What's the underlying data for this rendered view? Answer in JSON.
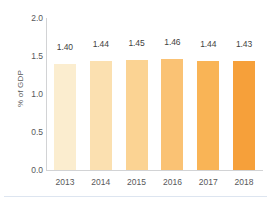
{
  "chart_data": {
    "type": "bar",
    "title": "",
    "subtitle": "",
    "xlabel": "",
    "ylabel": "% of GDP",
    "categories": [
      "2013",
      "2014",
      "2015",
      "2016",
      "2017",
      "2018"
    ],
    "values": [
      1.4,
      1.44,
      1.45,
      1.46,
      1.44,
      1.43
    ],
    "value_labels": [
      "1.40",
      "1.44",
      "1.45",
      "1.46",
      "1.44",
      "1.43"
    ],
    "ylim": [
      0.0,
      2.0
    ],
    "y_ticks": [
      0.0,
      0.5,
      1.0,
      1.5,
      2.0
    ],
    "y_tick_labels": [
      "0.0",
      "0.5",
      "1.0",
      "1.5",
      "2.0"
    ],
    "grid": false,
    "legend": "none",
    "bar_colors": [
      "#fbedcf",
      "#fbe0b0",
      "#fbd393",
      "#fac274",
      "#f9b456",
      "#f6a03a"
    ],
    "axis_color": "#d2d3d5",
    "text_color": "#58585a",
    "value_text_color": "#3f3f41",
    "background_color": "#ffffff",
    "separator_color": "#dde5f0"
  }
}
